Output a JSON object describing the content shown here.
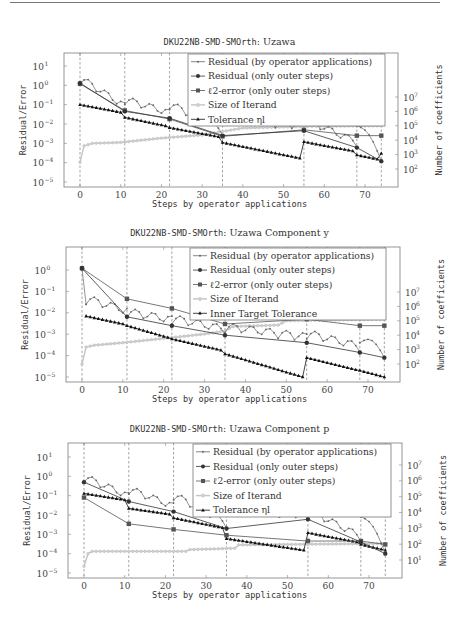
{
  "page": {
    "has_top_rule": true
  },
  "chart_data": [
    {
      "id": "uzawa",
      "type": "line",
      "title_mono": "DKU22NB-SMD-SMOrth",
      "title_rest": ": Uzawa",
      "xlabel": "Steps by operator applications",
      "ylabel": "Residual/Error",
      "ylabel_right": "Number of coefficients",
      "yscale": "log",
      "ylim": [
        1e-05,
        60
      ],
      "y_ticks": [
        "10^1",
        "10^0",
        "10^-1",
        "10^-2",
        "10^-3",
        "10^-4",
        "10^-5"
      ],
      "y_right_ticks": [
        "10^7",
        "10^6",
        "10^5",
        "10^4",
        "10^3",
        "10^2"
      ],
      "x_ticks": [
        0,
        10,
        20,
        30,
        40,
        50,
        60,
        70
      ],
      "xlim": [
        -4,
        78
      ],
      "outer_steps": [
        0,
        11,
        22,
        35,
        55,
        68,
        74
      ],
      "legend": [
        "Residual (by operator applications)",
        "Residual (only outer steps)",
        "ℓ2-error (only outer steps)",
        "Size of Iterand",
        "Tolerance ηl"
      ],
      "geom": {
        "top": 53,
        "bottom": 187,
        "left": 64,
        "right": 398,
        "x0": 80,
        "x70": 365,
        "y_exp_top": 1,
        "y_exp_top_px": 66,
        "y_exp_bot": -5,
        "y_exp_bot_px": 182,
        "r_exp_top": 7,
        "r_exp_top_px": 97,
        "r_exp_bot": 2,
        "r_exp_bot_px": 169,
        "legend": {
          "x": 188,
          "y": 54,
          "w": 197,
          "h": 72
        }
      },
      "series": [
        {
          "name": "Residual (only outer steps)",
          "x": [
            0,
            11,
            22,
            35,
            55,
            68,
            74
          ],
          "y": [
            1.3,
            0.045,
            0.02,
            0.0025,
            0.0045,
            0.0006,
            0.00012
          ]
        },
        {
          "name": "ℓ2-error (only outer steps)",
          "x": [
            0,
            11,
            22,
            35,
            55,
            68,
            74
          ],
          "y": [
            1.2,
            0.05,
            0.018,
            0.0023,
            0.005,
            0.0025,
            0.0025
          ]
        },
        {
          "name": "Tolerance ηl",
          "x": [
            0,
            1,
            2,
            3,
            4,
            5,
            6,
            7,
            8,
            9,
            10,
            11,
            12,
            13,
            14,
            15,
            16,
            17,
            18,
            19,
            20,
            21,
            22,
            23,
            24,
            25,
            26,
            27,
            28,
            29,
            30,
            31,
            32,
            33,
            34,
            35,
            36,
            37,
            38,
            39,
            40,
            41,
            42,
            43,
            44,
            45,
            46,
            47,
            48,
            49,
            50,
            51,
            52,
            53,
            54,
            55,
            56,
            57,
            58,
            59,
            60,
            61,
            62,
            63,
            64,
            65,
            66,
            67,
            68,
            69,
            70,
            71,
            72,
            73,
            74
          ],
          "segments": [
            [
              0,
              10,
              0.1,
              0.04
            ],
            [
              11,
              21,
              0.022,
              0.008
            ],
            [
              22,
              34,
              0.0065,
              0.0022
            ],
            [
              35,
              54,
              0.0011,
              0.00017
            ],
            [
              55,
              67,
              0.0012,
              0.0004
            ],
            [
              68,
              73,
              0.00025,
              0.00015
            ],
            [
              74,
              74,
              0.0003,
              0.0003
            ]
          ]
        },
        {
          "name": "Size of Iterand",
          "y_axis": "right",
          "points": [
            [
              0,
              300.0
            ],
            [
              1,
              4000.0
            ],
            [
              3,
              6000.0
            ],
            [
              10,
              7000.0
            ],
            [
              20,
              14000.0
            ],
            [
              30,
              23000.0
            ],
            [
              35,
              40000.0
            ],
            [
              40,
              70000.0
            ],
            [
              55,
              90000.0
            ],
            [
              74,
              100000.0
            ]
          ]
        },
        {
          "name": "Residual (by operator applications)",
          "arch_segments": [
            [
              0,
              11,
              1.3,
              0.045,
              0.35
            ],
            [
              11,
              22,
              0.1,
              0.02,
              0.06
            ],
            [
              22,
              35,
              0.06,
              0.0025,
              0.02
            ],
            [
              35,
              55,
              0.01,
              0.0045,
              0.01
            ],
            [
              55,
              68,
              0.01,
              0.0006,
              0.008
            ],
            [
              68,
              74,
              0.008,
              0.00012,
              0.006
            ]
          ]
        }
      ]
    },
    {
      "id": "uzawa-y",
      "type": "line",
      "title_mono": "DKU22NB-SMD-SMOrth",
      "title_rest": ": Uzawa Component y",
      "xlabel": "Steps by operator applications",
      "ylabel": "Residual/Error",
      "ylabel_right": "Number of coefficients",
      "yscale": "log",
      "y_ticks": [
        "10^0",
        "10^-1",
        "10^-2",
        "10^-3",
        "10^-4",
        "10^-5"
      ],
      "y_right_ticks": [
        "10^7",
        "10^6",
        "10^5",
        "10^4",
        "10^3",
        "10^2"
      ],
      "x_ticks": [
        0,
        10,
        20,
        30,
        40,
        50,
        60,
        70
      ],
      "outer_steps": [
        0,
        11,
        22,
        35,
        55,
        68,
        74
      ],
      "legend": [
        "Residual (by operator applications)",
        "Residual (only outer steps)",
        "ℓ2-error (only outer steps)",
        "Size of Iterand",
        "Inner Target Tolerance"
      ],
      "geom": {
        "top": 247,
        "bottom": 382,
        "left": 66,
        "right": 400,
        "x0": 82,
        "x70": 368,
        "y_exp_top": 0,
        "y_exp_top_px": 270,
        "y_exp_bot": -5,
        "y_exp_bot_px": 377,
        "r_exp_top": 7,
        "r_exp_top_px": 292,
        "r_exp_bot": 2,
        "r_exp_bot_px": 364,
        "legend": {
          "x": 190,
          "y": 248,
          "w": 196,
          "h": 72
        }
      },
      "series": [
        {
          "name": "Residual (only outer steps)",
          "x": [
            0,
            11,
            22,
            35,
            55,
            68,
            74
          ],
          "y": [
            1.2,
            0.0065,
            0.0025,
            0.0009,
            0.0004,
            0.00014,
            8e-05
          ]
        },
        {
          "name": "ℓ2-error (only outer steps)",
          "x": [
            0,
            11,
            22,
            35,
            55,
            68,
            74
          ],
          "y": [
            1.2,
            0.045,
            0.016,
            0.003,
            0.005,
            0.0025,
            0.0025
          ]
        },
        {
          "name": "Inner Target Tolerance",
          "segments": [
            [
              1,
              10,
              0.007,
              0.003
            ],
            [
              11,
              21,
              0.0025,
              0.0007
            ],
            [
              22,
              34,
              0.0006,
              0.00018
            ],
            [
              35,
              54,
              0.00012,
              1e-05
            ],
            [
              55,
              67,
              8e-05,
              2.2e-05
            ],
            [
              68,
              74,
              2e-05,
              1e-05
            ]
          ]
        },
        {
          "name": "Size of Iterand",
          "y_axis": "right",
          "points": [
            [
              0,
              100.0
            ],
            [
              1,
              1500.0
            ],
            [
              3,
              2000.0
            ],
            [
              10,
              3000.0
            ],
            [
              20,
              6000.0
            ],
            [
              30,
              12000.0
            ],
            [
              35,
              20000.0
            ],
            [
              37,
              40000.0
            ],
            [
              48,
              50000.0
            ],
            [
              50,
              100000.0
            ],
            [
              74,
              130000.0
            ]
          ]
        },
        {
          "name": "Residual (by operator applications)",
          "arch_segments": [
            [
              0,
              1,
              1.2,
              0.025,
              0
            ],
            [
              1,
              11,
              0.025,
              0.0065,
              0.02
            ],
            [
              11,
              22,
              0.006,
              0.0025,
              0.004
            ],
            [
              22,
              35,
              0.003,
              0.0009,
              0.003
            ],
            [
              35,
              55,
              0.0012,
              0.0004,
              0.0012
            ],
            [
              55,
              68,
              0.0006,
              0.00014,
              0.0006
            ],
            [
              68,
              74,
              0.0004,
              8e-05,
              0.0004
            ]
          ]
        }
      ]
    },
    {
      "id": "uzawa-p",
      "type": "line",
      "title_mono": "DKU22NB-SMD-SMOrth",
      "title_rest": ": Uzawa Component p",
      "xlabel": "Steps by operator applications",
      "ylabel": "Residual/Error",
      "ylabel_right": "Number of coefficients",
      "yscale": "log",
      "y_ticks": [
        "10^1",
        "10^0",
        "10^-1",
        "10^-2",
        "10^-3",
        "10^-4",
        "10^-5"
      ],
      "y_right_ticks": [
        "10^7",
        "10^6",
        "10^5",
        "10^4",
        "10^3",
        "10^2",
        "10^1"
      ],
      "x_ticks": [
        0,
        10,
        20,
        30,
        40,
        50,
        60,
        70
      ],
      "outer_steps": [
        0,
        11,
        22,
        35,
        55,
        68,
        74
      ],
      "legend": [
        "Residual (by operator applications)",
        "Residual (only outer steps)",
        "ℓ2-error (only outer steps)",
        "Size of Iterand",
        "Tolerance ηl"
      ],
      "geom": {
        "top": 443,
        "bottom": 578,
        "left": 68,
        "right": 402,
        "x0": 84,
        "x70": 369,
        "y_exp_top": 1,
        "y_exp_top_px": 457,
        "y_exp_bot": -5,
        "y_exp_bot_px": 573,
        "r_exp_top": 7,
        "r_exp_top_px": 465,
        "r_exp_bot": 1,
        "r_exp_bot_px": 560,
        "legend": {
          "x": 193,
          "y": 444,
          "w": 198,
          "h": 73
        }
      },
      "series": [
        {
          "name": "Residual (only outer steps)",
          "x": [
            0,
            11,
            22,
            35,
            55,
            68,
            74
          ],
          "y": [
            0.5,
            0.05,
            0.015,
            0.002,
            0.006,
            0.0004,
            0.0001
          ]
        },
        {
          "name": "ℓ2-error (only outer steps)",
          "x": [
            0,
            11,
            22,
            35,
            55,
            68,
            74
          ],
          "y": [
            0.08,
            0.0035,
            0.0018,
            0.0009,
            0.00045,
            0.00045,
            0.0003
          ]
        },
        {
          "name": "Tolerance ηl",
          "segments": [
            [
              0,
              10,
              0.13,
              0.06
            ],
            [
              11,
              21,
              0.022,
              0.011
            ],
            [
              22,
              34,
              0.007,
              0.0022
            ],
            [
              35,
              54,
              0.0006,
              0.00015
            ],
            [
              55,
              67,
              0.0012,
              0.0004
            ],
            [
              68,
              74,
              0.0003,
              0.00015
            ]
          ]
        },
        {
          "name": "Size of Iterand",
          "y_axis": "right",
          "points": [
            [
              0,
              4
            ],
            [
              1,
              25
            ],
            [
              2,
              35
            ],
            [
              25,
              35
            ],
            [
              26,
              45
            ],
            [
              37,
              55
            ],
            [
              38,
              90
            ],
            [
              74,
              110
            ]
          ]
        },
        {
          "name": "Residual (by operator applications)",
          "arch_segments": [
            [
              0,
              11,
              0.5,
              0.05,
              0.25
            ],
            [
              11,
              22,
              0.12,
              0.015,
              0.1
            ],
            [
              22,
              35,
              0.06,
              0.002,
              0.06
            ],
            [
              35,
              55,
              0.01,
              0.006,
              0.01
            ],
            [
              55,
              68,
              0.01,
              0.0004,
              0.01
            ],
            [
              68,
              74,
              0.008,
              0.0001,
              0.008
            ]
          ]
        }
      ]
    }
  ]
}
